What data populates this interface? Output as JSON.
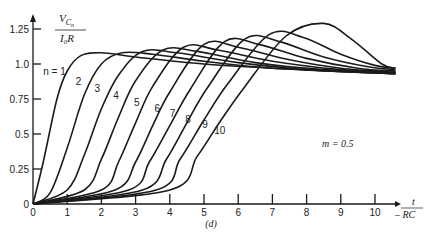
{
  "chart_data": {
    "type": "line",
    "title": "",
    "caption": "(d)",
    "xlabel": "t / RC",
    "ylabel": "V_Cn / (I0 R)",
    "xlim": [
      0,
      10.8
    ],
    "ylim": [
      0,
      1.3
    ],
    "x_ticks": [
      "0",
      "1",
      "2",
      "3",
      "4",
      "5",
      "6",
      "7",
      "8",
      "9",
      "10"
    ],
    "y_ticks": [
      "0",
      "0.25",
      "0.5",
      "0.75",
      "1.0",
      "1.25"
    ],
    "grid": false,
    "annotation": "m = 0.5",
    "series_label_prefix": "n = ",
    "series": [
      {
        "name": "1",
        "points": [
          [
            0,
            0
          ],
          [
            0.3,
            0.3
          ],
          [
            0.7,
            0.75
          ],
          [
            1.0,
            0.95
          ],
          [
            1.4,
            1.06
          ],
          [
            2.0,
            1.08
          ],
          [
            3,
            1.05
          ],
          [
            5,
            1.0
          ],
          [
            7,
            0.97
          ],
          [
            10.6,
            0.93
          ]
        ]
      },
      {
        "name": "2",
        "points": [
          [
            0,
            0
          ],
          [
            0.5,
            0.08
          ],
          [
            1.0,
            0.4
          ],
          [
            1.5,
            0.78
          ],
          [
            2.0,
            1.0
          ],
          [
            2.6,
            1.08
          ],
          [
            3.5,
            1.07
          ],
          [
            5,
            1.02
          ],
          [
            7,
            0.97
          ],
          [
            10.6,
            0.93
          ]
        ]
      },
      {
        "name": "3",
        "points": [
          [
            0,
            0
          ],
          [
            1.0,
            0.1
          ],
          [
            1.5,
            0.35
          ],
          [
            2.0,
            0.68
          ],
          [
            2.5,
            0.92
          ],
          [
            3.2,
            1.09
          ],
          [
            4.2,
            1.08
          ],
          [
            6,
            1.01
          ],
          [
            8,
            0.96
          ],
          [
            10.6,
            0.93
          ]
        ]
      },
      {
        "name": "4",
        "points": [
          [
            0,
            0
          ],
          [
            1.5,
            0.1
          ],
          [
            2.0,
            0.32
          ],
          [
            2.5,
            0.62
          ],
          [
            3.0,
            0.88
          ],
          [
            3.8,
            1.1
          ],
          [
            4.8,
            1.09
          ],
          [
            6.5,
            1.01
          ],
          [
            8.5,
            0.96
          ],
          [
            10.6,
            0.94
          ]
        ]
      },
      {
        "name": "5",
        "points": [
          [
            0,
            0
          ],
          [
            2.0,
            0.1
          ],
          [
            2.5,
            0.3
          ],
          [
            3.0,
            0.58
          ],
          [
            3.5,
            0.84
          ],
          [
            4.4,
            1.12
          ],
          [
            5.4,
            1.1
          ],
          [
            7,
            1.02
          ],
          [
            9,
            0.96
          ],
          [
            10.6,
            0.94
          ]
        ]
      },
      {
        "name": "6",
        "points": [
          [
            0,
            0
          ],
          [
            2.4,
            0.1
          ],
          [
            3.0,
            0.3
          ],
          [
            3.5,
            0.56
          ],
          [
            4.0,
            0.8
          ],
          [
            5.0,
            1.14
          ],
          [
            6.0,
            1.12
          ],
          [
            7.5,
            1.03
          ],
          [
            9,
            0.97
          ],
          [
            10.6,
            0.94
          ]
        ]
      },
      {
        "name": "7",
        "points": [
          [
            0,
            0
          ],
          [
            2.8,
            0.1
          ],
          [
            3.4,
            0.3
          ],
          [
            4.0,
            0.56
          ],
          [
            4.6,
            0.82
          ],
          [
            5.6,
            1.16
          ],
          [
            6.6,
            1.14
          ],
          [
            8,
            1.04
          ],
          [
            9.5,
            0.97
          ],
          [
            10.6,
            0.95
          ]
        ]
      },
      {
        "name": "8",
        "points": [
          [
            0,
            0
          ],
          [
            3.2,
            0.1
          ],
          [
            3.9,
            0.32
          ],
          [
            4.5,
            0.58
          ],
          [
            5.1,
            0.83
          ],
          [
            6.2,
            1.18
          ],
          [
            7.2,
            1.16
          ],
          [
            8.5,
            1.05
          ],
          [
            9.8,
            0.98
          ],
          [
            10.6,
            0.96
          ]
        ]
      },
      {
        "name": "9",
        "points": [
          [
            0,
            0
          ],
          [
            3.6,
            0.1
          ],
          [
            4.3,
            0.32
          ],
          [
            5.0,
            0.6
          ],
          [
            5.7,
            0.86
          ],
          [
            6.9,
            1.21
          ],
          [
            7.9,
            1.19
          ],
          [
            9,
            1.07
          ],
          [
            10,
            0.99
          ],
          [
            10.6,
            0.97
          ]
        ]
      },
      {
        "name": "10",
        "points": [
          [
            0,
            0
          ],
          [
            4.0,
            0.1
          ],
          [
            4.8,
            0.34
          ],
          [
            5.5,
            0.6
          ],
          [
            6.2,
            0.84
          ],
          [
            7.4,
            1.2
          ],
          [
            8.5,
            1.29
          ],
          [
            9.3,
            1.18
          ],
          [
            10.2,
            1.0
          ],
          [
            10.6,
            0.97
          ]
        ]
      }
    ],
    "label_positions": [
      {
        "text": "n = 1",
        "x": 0.3,
        "y": 0.92
      },
      {
        "text": "2",
        "x": 1.25,
        "y": 0.85
      },
      {
        "text": "3",
        "x": 1.8,
        "y": 0.8
      },
      {
        "text": "4",
        "x": 2.35,
        "y": 0.75
      },
      {
        "text": "5",
        "x": 2.95,
        "y": 0.7
      },
      {
        "text": "6",
        "x": 3.55,
        "y": 0.66
      },
      {
        "text": "7",
        "x": 4.0,
        "y": 0.62
      },
      {
        "text": "8",
        "x": 4.45,
        "y": 0.58
      },
      {
        "text": "9",
        "x": 4.95,
        "y": 0.54
      },
      {
        "text": "10",
        "x": 5.3,
        "y": 0.5
      }
    ]
  }
}
